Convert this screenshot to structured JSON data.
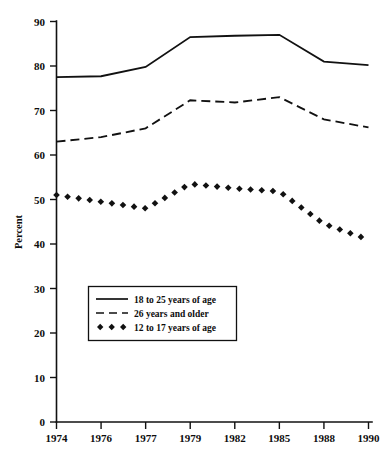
{
  "chart_data": {
    "type": "line",
    "title": "",
    "subtitle": "",
    "xlabel": "",
    "ylabel": "Percent",
    "ylim": [
      0,
      90
    ],
    "ytick_step": 10,
    "yticks": [
      "0",
      "10",
      "20",
      "30",
      "40",
      "50",
      "60",
      "70",
      "80",
      "90"
    ],
    "grid": false,
    "legend_position": "inside-lower-left",
    "categories": [
      "1974",
      "1976",
      "1977",
      "1979",
      "1982",
      "1985",
      "1988",
      "1990"
    ],
    "xticks": [
      "1974",
      "1976",
      "1977",
      "1979",
      "1982",
      "1985",
      "1988",
      "1990"
    ],
    "series": [
      {
        "name": "18 to 25 years of age",
        "style": "solid",
        "values": [
          77.5,
          77.7,
          79.8,
          86.5,
          86.8,
          87.0,
          81.0,
          80.2
        ]
      },
      {
        "name": "26 years and older",
        "style": "dashed",
        "values": [
          63.0,
          64.0,
          66.0,
          72.3,
          71.8,
          73.0,
          68.0,
          66.2
        ]
      },
      {
        "name": "12 to 17 years of age",
        "style": "dotted-diamond",
        "values": [
          51.0,
          49.5,
          48.0,
          53.5,
          52.5,
          51.8,
          44.5,
          41.0
        ]
      }
    ]
  },
  "legend": {
    "entries": [
      {
        "label": "18 to 25 years of age",
        "marker": "solid-line"
      },
      {
        "label": "26 years and older",
        "marker": "dashed-line"
      },
      {
        "label": "12 to 17 years of age",
        "marker": "diamond-dots"
      }
    ]
  },
  "axes": {
    "y_title": "Percent"
  }
}
